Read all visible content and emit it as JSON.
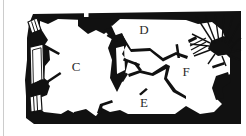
{
  "figure": {
    "kind": "architectural-floor-plan",
    "background_color": "#ffffff",
    "wall_color": "#111111",
    "label_color": "#2b2b2b"
  },
  "room_labels": [
    {
      "id": "room-c",
      "text": "C",
      "x": 76,
      "y": 68
    },
    {
      "id": "room-d",
      "text": "D",
      "x": 144,
      "y": 31
    },
    {
      "id": "room-e",
      "text": "E",
      "x": 144,
      "y": 104
    },
    {
      "id": "room-f",
      "text": "F",
      "x": 186,
      "y": 73
    }
  ],
  "features": {
    "window_openings_label": "hatched wall openings",
    "window_count": 3,
    "central_pillar_label": "central pillar",
    "collapse_fan_label": "radiating collapse / vault springing",
    "top_wall_marker_label": "square niche marker in north wall",
    "outline_bay_label": "outlined projecting bay on west wall"
  },
  "page": {
    "left_rule_label": "page margin rule"
  }
}
